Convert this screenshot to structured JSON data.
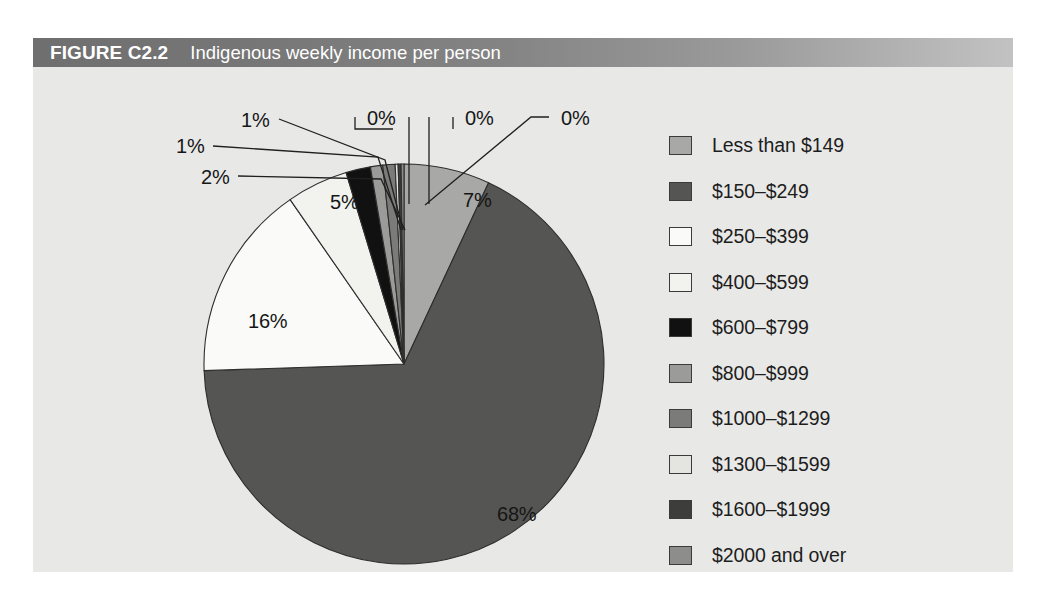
{
  "figure": {
    "number": "FIGURE C2.2",
    "caption": "Indigenous weekly income per person"
  },
  "colors": {
    "panel_background": "#e8e8e6",
    "title_bar_left": "#6f6f6f",
    "title_bar_right": "#c2c2c2",
    "title_text": "#ffffff",
    "label_text": "#161616",
    "slice_border": "#2e2e2e"
  },
  "chart_data": {
    "type": "pie",
    "title": "Indigenous weekly income per person",
    "legend_position": "right",
    "start_angle_deg": 0,
    "direction": "clockwise",
    "units": "percent",
    "categories": [
      "Less than $149",
      "$150–$249",
      "$250–$399",
      "$400–$599",
      "$600–$799",
      "$800–$999",
      "$1000–$1299",
      "$1300–$1599",
      "$1600–$1999",
      "$2000 and over"
    ],
    "values": [
      7,
      68,
      16,
      5,
      2,
      1,
      1,
      0,
      0,
      0
    ],
    "value_labels": [
      "7%",
      "68%",
      "16%",
      "5%",
      "2%",
      "1%",
      "1%",
      "0%",
      "0%",
      "0%"
    ],
    "slice_colors": [
      "#a8a8a6",
      "#555553",
      "#fafaf8",
      "#f2f2ef",
      "#111111",
      "#9b9b99",
      "#7b7b79",
      "#e4e4e1",
      "#3d3d3b",
      "#8d8d8b"
    ]
  },
  "legend": {
    "items": [
      {
        "label": "Less than $149",
        "color": "#a8a8a6"
      },
      {
        "label": "$150–$249",
        "color": "#555553"
      },
      {
        "label": "$250–$399",
        "color": "#fafaf8"
      },
      {
        "label": "$400–$599",
        "color": "#f2f2ef"
      },
      {
        "label": "$600–$799",
        "color": "#111111"
      },
      {
        "label": "$800–$999",
        "color": "#9b9b99"
      },
      {
        "label": "$1000–$1299",
        "color": "#7b7b79"
      },
      {
        "label": "$1300–$1599",
        "color": "#e4e4e1"
      },
      {
        "label": "$1600–$1999",
        "color": "#3d3d3b"
      },
      {
        "label": "$2000 and over",
        "color": "#8d8d8b"
      }
    ]
  },
  "callouts": [
    {
      "name": "callout-1600-1999",
      "text": "1%",
      "x": 143,
      "y": 68
    },
    {
      "name": "callout-1300-1599",
      "text": "1%",
      "x": 208,
      "y": 42
    },
    {
      "name": "callout-800-999",
      "text": "2%",
      "x": 168,
      "y": 99
    },
    {
      "name": "callout-1000-1299",
      "text": "0%",
      "x": 334,
      "y": 40
    },
    {
      "name": "callout-2000-over",
      "text": "0%",
      "x": 432,
      "y": 40
    },
    {
      "name": "callout-extra",
      "text": "0%",
      "x": 528,
      "y": 40
    },
    {
      "name": "callout-400-599",
      "text": "5%",
      "x": 297,
      "y": 124
    },
    {
      "name": "callout-250-399",
      "text": "16%",
      "x": 215,
      "y": 243
    },
    {
      "name": "callout-less-149",
      "text": "7%",
      "x": 430,
      "y": 122
    },
    {
      "name": "callout-150-249",
      "text": "68%",
      "x": 464,
      "y": 436
    }
  ]
}
